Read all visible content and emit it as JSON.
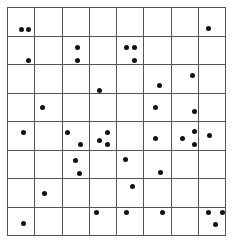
{
  "grid": {
    "rows": 8,
    "cols": 8,
    "line_color": "#555555",
    "dot_color": "#111111"
  },
  "dots": [
    [
      21,
      29
    ],
    [
      28,
      29
    ],
    [
      208,
      28
    ],
    [
      28,
      60
    ],
    [
      77,
      47
    ],
    [
      77,
      60
    ],
    [
      126,
      47
    ],
    [
      134,
      47
    ],
    [
      134,
      60
    ],
    [
      99,
      90
    ],
    [
      192,
      75
    ],
    [
      159,
      85
    ],
    [
      42,
      107
    ],
    [
      155,
      107
    ],
    [
      194,
      111
    ],
    [
      23,
      132
    ],
    [
      67,
      132
    ],
    [
      80,
      144
    ],
    [
      99,
      140
    ],
    [
      107,
      132
    ],
    [
      107,
      144
    ],
    [
      155,
      138
    ],
    [
      182,
      138
    ],
    [
      194,
      131
    ],
    [
      194,
      144
    ],
    [
      209,
      135
    ],
    [
      75,
      160
    ],
    [
      79,
      173
    ],
    [
      125,
      159
    ],
    [
      160,
      172
    ],
    [
      44,
      193
    ],
    [
      132,
      186
    ],
    [
      23,
      223
    ],
    [
      96,
      212
    ],
    [
      126,
      212
    ],
    [
      162,
      212
    ],
    [
      208,
      212
    ],
    [
      222,
      212
    ],
    [
      215,
      224
    ]
  ]
}
